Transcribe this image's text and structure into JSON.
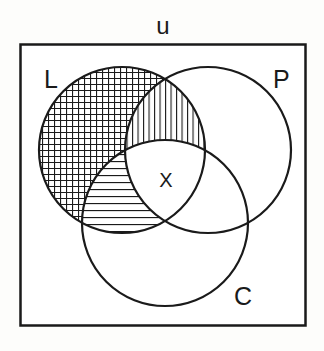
{
  "diagram": {
    "type": "venn",
    "universe_label": "u",
    "sets": [
      {
        "id": "L",
        "label": "L",
        "cx": 122,
        "cy": 150,
        "r": 83
      },
      {
        "id": "P",
        "label": "P",
        "cx": 208,
        "cy": 150,
        "r": 83
      },
      {
        "id": "C",
        "label": "C",
        "cx": 165,
        "cy": 223,
        "r": 83
      }
    ],
    "regions": [
      {
        "name": "L only",
        "pattern": "crosshatch"
      },
      {
        "name": "L and P, not C",
        "pattern": "vertical-lines"
      },
      {
        "name": "L and C, not P",
        "pattern": "horizontal-lines"
      },
      {
        "name": "L and P and C",
        "pattern": "none",
        "label": "X"
      }
    ],
    "center_label": "X",
    "colors": {
      "stroke": "#1a1a1a",
      "background": "#fdfdfb"
    }
  }
}
